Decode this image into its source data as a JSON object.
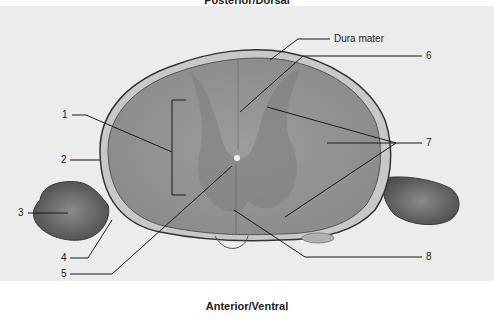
{
  "figure": {
    "top_orientation": "Posterior/Dorsal",
    "bottom_orientation": "Anterior/Ventral",
    "colors": {
      "background": "#ececec",
      "tissue_light": "#a8a8a8",
      "tissue_dark": "#7a7a7a",
      "leader_line": "#1a1a1a"
    },
    "labels": [
      {
        "id": "dura",
        "text": "Dura mater"
      },
      {
        "id": "1",
        "text": "1"
      },
      {
        "id": "2",
        "text": "2"
      },
      {
        "id": "3",
        "text": "3"
      },
      {
        "id": "4",
        "text": "4"
      },
      {
        "id": "5",
        "text": "5"
      },
      {
        "id": "6",
        "text": "6"
      },
      {
        "id": "7",
        "text": "7"
      },
      {
        "id": "8",
        "text": "8"
      }
    ]
  }
}
